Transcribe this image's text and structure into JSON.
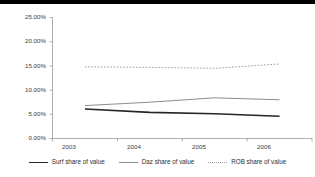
{
  "chart_data": {
    "type": "line",
    "title": "",
    "xlabel": "",
    "ylabel": "",
    "categories": [
      "2003",
      "2004",
      "2005",
      "2006"
    ],
    "x": [
      2003,
      2004,
      2005,
      2006
    ],
    "ylim": [
      0,
      25
    ],
    "yticks": [
      0,
      5,
      10,
      15,
      20,
      25
    ],
    "ytick_labels": [
      "0.00%",
      "5.00%",
      "10.00%",
      "15.00%",
      "20.00%",
      "25.00%"
    ],
    "grid": false,
    "legend_position": "bottom",
    "series": [
      {
        "name": "Surf share of value",
        "values": [
          6.1,
          5.4,
          5.1,
          4.6
        ],
        "color": "#262626",
        "style": "solid",
        "width": 1.6
      },
      {
        "name": "Daz share of value",
        "values": [
          6.8,
          7.5,
          8.4,
          8.0
        ],
        "color": "#8d8d8d",
        "style": "solid",
        "width": 1.0
      },
      {
        "name": "ROB share of value",
        "values": [
          14.8,
          14.7,
          14.5,
          15.4
        ],
        "color": "#9d9da8",
        "style": "dotted",
        "width": 1.0
      }
    ]
  },
  "axis": {
    "ytick_0": "0.00%",
    "ytick_1": "5.00%",
    "ytick_2": "10.00%",
    "ytick_3": "15.00%",
    "ytick_4": "20.00%",
    "ytick_5": "25.00%",
    "xtick_0": "2003",
    "xtick_1": "2004",
    "xtick_2": "2005",
    "xtick_3": "2006"
  },
  "legend": {
    "items": [
      {
        "label": "Surf share of value"
      },
      {
        "label": "Daz share of value"
      },
      {
        "label": "ROB share of value"
      }
    ]
  }
}
